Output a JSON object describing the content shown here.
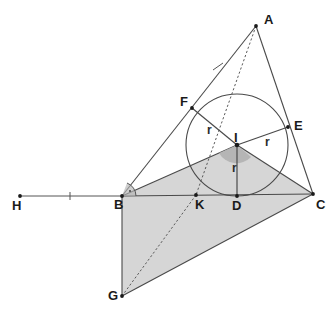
{
  "figure": {
    "type": "geometry-diagram",
    "canvas": {
      "width": 335,
      "height": 321,
      "background": "#ffffff"
    }
  },
  "colors": {
    "stroke": "#4a4a4a",
    "stroke_thin": "#555555",
    "dashed": "#5a5a5a",
    "shaded_fill": "#d6d6d6",
    "angle_marker_fill": "#b3b3b3",
    "label_text": "#1a1a1a",
    "vertex_dot": "#1a1a1a"
  },
  "points": [
    {
      "id": "A",
      "label": "A",
      "x": 256,
      "y": 26,
      "label_x": 264,
      "label_y": 24,
      "dot": true
    },
    {
      "id": "B",
      "label": "B",
      "x": 122,
      "y": 196,
      "label_x": 114,
      "label_y": 209,
      "dot": true
    },
    {
      "id": "C",
      "label": "C",
      "x": 313,
      "y": 194,
      "label_x": 316,
      "label_y": 209,
      "dot": true
    },
    {
      "id": "D",
      "label": "D",
      "x": 237,
      "y": 196,
      "label_x": 232,
      "label_y": 210,
      "dot": true
    },
    {
      "id": "E",
      "label": "E",
      "x": 288,
      "y": 127,
      "label_x": 294,
      "label_y": 130,
      "dot": true
    },
    {
      "id": "F",
      "label": "F",
      "x": 192,
      "y": 108,
      "label_x": 180,
      "label_y": 106,
      "dot": true
    },
    {
      "id": "G",
      "label": "G",
      "x": 122,
      "y": 296,
      "label_x": 108,
      "label_y": 300,
      "dot": true
    },
    {
      "id": "H",
      "label": "H",
      "x": 20,
      "y": 196,
      "label_x": 12,
      "label_y": 210,
      "dot": true
    },
    {
      "id": "I",
      "label": "I",
      "x": 237,
      "y": 145,
      "label_x": 236,
      "label_y": 142,
      "dot": true
    },
    {
      "id": "K",
      "label": "K",
      "x": 196,
      "y": 195,
      "label_x": 195,
      "label_y": 209,
      "dot": true
    }
  ],
  "incircle": {
    "center_x": 237,
    "center_y": 145,
    "radius": 51
  },
  "radius_labels": [
    {
      "id": "r-IF",
      "label": "r",
      "x": 207,
      "y": 134
    },
    {
      "id": "r-IE",
      "label": "r",
      "x": 265,
      "y": 146
    },
    {
      "id": "r-ID",
      "label": "r",
      "x": 232,
      "y": 172
    }
  ],
  "segments": [
    {
      "id": "AB",
      "from": "A",
      "to": "B",
      "style": "solid"
    },
    {
      "id": "AC",
      "from": "A",
      "to": "C",
      "style": "solid"
    },
    {
      "id": "BC",
      "from": "B",
      "to": "C",
      "style": "solid"
    },
    {
      "id": "HB",
      "from": "H",
      "to": "B",
      "style": "solid"
    },
    {
      "id": "AI-extended-to-K",
      "from": "A",
      "to": "K",
      "style": "dashed"
    },
    {
      "id": "KG",
      "from": "K",
      "to": "G",
      "style": "dashed"
    },
    {
      "id": "IF",
      "from": "I",
      "to": "F",
      "style": "radius"
    },
    {
      "id": "IE",
      "from": "I",
      "to": "E",
      "style": "radius"
    },
    {
      "id": "ID",
      "from": "I",
      "to": "D",
      "style": "radius"
    },
    {
      "id": "BG",
      "from": "B",
      "to": "G",
      "style": "solid"
    },
    {
      "id": "GC",
      "from": "G",
      "to": "C",
      "style": "solid"
    }
  ],
  "shaded_region": {
    "id": "parallelogram-BICG-region",
    "vertices": [
      "I",
      "C",
      "G",
      "B"
    ],
    "fill": "#d6d6d6"
  },
  "tick_marks": [
    {
      "id": "tick-on-AB",
      "x": 218,
      "y": 67,
      "note": "congruence tick on segment AB"
    },
    {
      "id": "tick-on-HB",
      "x": 70,
      "y": 196,
      "note": "congruence tick on ray HB"
    }
  ],
  "angle_markers": [
    {
      "id": "right-angle-at-B",
      "vertex": "B",
      "kind": "right-angle-arc"
    },
    {
      "id": "angle-at-I",
      "vertex": "I",
      "kind": "filled-sector"
    }
  ]
}
